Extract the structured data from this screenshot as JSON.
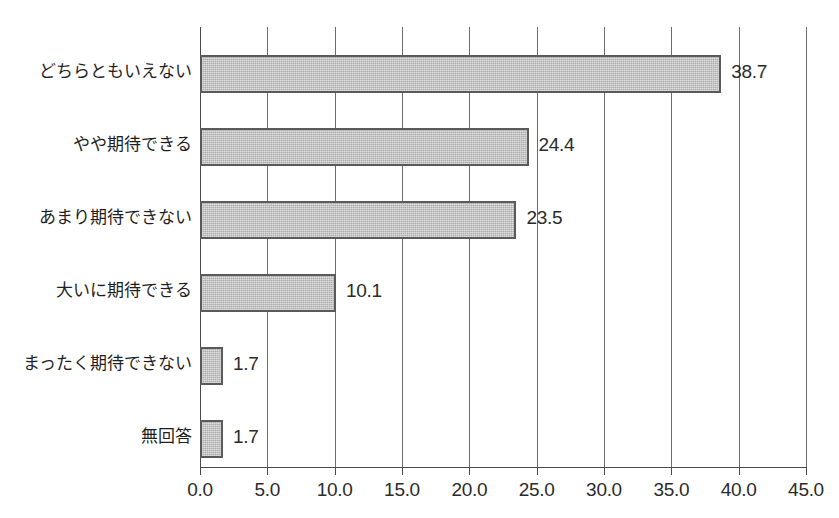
{
  "chart_data": {
    "type": "bar",
    "orientation": "horizontal",
    "title": "",
    "xlabel": "",
    "ylabel": "",
    "xlim": [
      0.0,
      45.0
    ],
    "xticks": [
      "0.0",
      "5.0",
      "10.0",
      "15.0",
      "20.0",
      "25.0",
      "30.0",
      "35.0",
      "40.0",
      "45.0"
    ],
    "xtick_values": [
      0,
      5,
      10,
      15,
      20,
      25,
      30,
      35,
      40,
      45
    ],
    "grid": "vertical",
    "legend": "none",
    "categories": [
      "どちらともいえない",
      "やや期待できる",
      "あまり期待できない",
      "大いに期待できる",
      "まったく期待できない",
      "無回答"
    ],
    "values": [
      38.7,
      24.4,
      23.5,
      10.1,
      1.7,
      1.7
    ],
    "value_labels": [
      "38.7",
      "24.4",
      "23.5",
      "10.1",
      "1.7",
      "1.7"
    ],
    "bar_fill_color": "#acacac",
    "bar_border_color": "#5a5a5a",
    "axis_color": "#4a4a4a",
    "grid_color": "#6d6d6d",
    "text_color": "#2b2b2b"
  }
}
